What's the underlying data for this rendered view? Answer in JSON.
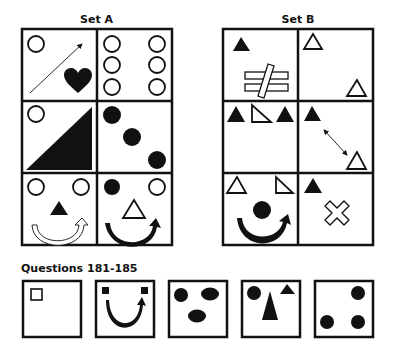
{
  "set_a": {
    "title": "Set A",
    "cells": [
      {
        "row": 1,
        "col": 1,
        "shapes": [
          "hollow-circle",
          "diagonal-arrow",
          "filled-heart"
        ]
      },
      {
        "row": 1,
        "col": 2,
        "shapes": [
          "hollow-circle x6"
        ]
      },
      {
        "row": 2,
        "col": 1,
        "shapes": [
          "hollow-circle",
          "filled-right-triangle"
        ]
      },
      {
        "row": 2,
        "col": 2,
        "shapes": [
          "filled-circle x3 diagonal"
        ]
      },
      {
        "row": 3,
        "col": 1,
        "shapes": [
          "hollow-circle x2",
          "filled-triangle",
          "hollow-curved-arrow"
        ]
      },
      {
        "row": 3,
        "col": 2,
        "shapes": [
          "filled-circle",
          "hollow-circle",
          "hollow-triangle",
          "filled-curved-arrow"
        ]
      }
    ]
  },
  "set_b": {
    "title": "Set B",
    "cells": [
      {
        "row": 1,
        "col": 1,
        "shapes": [
          "filled-triangle",
          "hollow-not-equal-sign"
        ]
      },
      {
        "row": 1,
        "col": 2,
        "shapes": [
          "hollow-triangle x2"
        ]
      },
      {
        "row": 2,
        "col": 1,
        "shapes": [
          "filled-triangle",
          "hollow-right-triangle",
          "filled-triangle"
        ]
      },
      {
        "row": 2,
        "col": 2,
        "shapes": [
          "filled-triangle",
          "double-arrow",
          "hollow-triangle"
        ]
      },
      {
        "row": 3,
        "col": 1,
        "shapes": [
          "hollow-triangle",
          "hollow-right-triangle",
          "filled-circle",
          "filled-curved-arrow"
        ]
      },
      {
        "row": 3,
        "col": 2,
        "shapes": [
          "filled-triangle",
          "hollow-cross"
        ]
      }
    ]
  },
  "questions": {
    "title": "Questions 181-185",
    "items": [
      {
        "number": 181,
        "shapes": [
          "hollow-square"
        ]
      },
      {
        "number": 182,
        "shapes": [
          "filled-square x2",
          "filled-curved-arrow"
        ]
      },
      {
        "number": 183,
        "shapes": [
          "filled-circle",
          "filled-ellipse x2"
        ]
      },
      {
        "number": 184,
        "shapes": [
          "filled-circle",
          "filled-tall-triangle",
          "filled-small-triangle"
        ]
      },
      {
        "number": 185,
        "shapes": [
          "filled-circle x3"
        ]
      }
    ]
  },
  "colors": {
    "ink": "#111111",
    "background": "#ffffff"
  }
}
